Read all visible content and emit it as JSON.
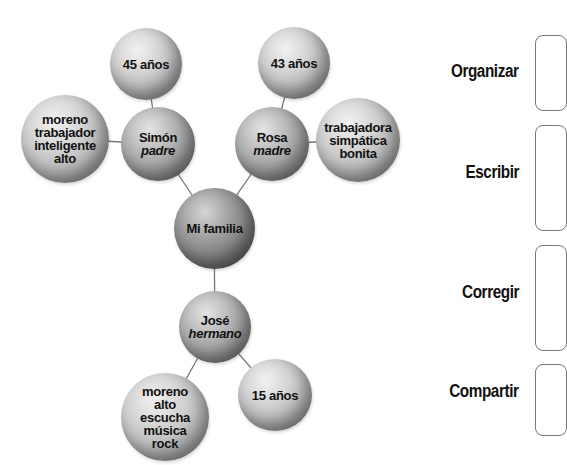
{
  "diagram": {
    "type": "concept-web",
    "center": {
      "label": "Mi familia"
    },
    "nodes": {
      "father": {
        "name": "Simón",
        "relation": "padre"
      },
      "father_age": {
        "label": "45 años"
      },
      "father_traits": {
        "lines": [
          "moreno",
          "trabajador",
          "inteligente",
          "alto"
        ]
      },
      "mother": {
        "name": "Rosa",
        "relation": "madre"
      },
      "mother_age": {
        "label": "43 años"
      },
      "mother_traits": {
        "lines": [
          "trabajadora",
          "simpática",
          "bonita"
        ]
      },
      "brother": {
        "name": "José",
        "relation": "hermano"
      },
      "brother_age": {
        "label": "15 años"
      },
      "brother_traits": {
        "lines": [
          "moreno",
          "alto",
          "escucha",
          "música",
          "rock"
        ]
      }
    }
  },
  "steps": [
    {
      "label": "Organizar"
    },
    {
      "label": "Escribir"
    },
    {
      "label": "Corregir"
    },
    {
      "label": "Compartir"
    }
  ],
  "colors": {
    "connector": "#777777",
    "box_border": "#777777",
    "text": "#111111"
  }
}
